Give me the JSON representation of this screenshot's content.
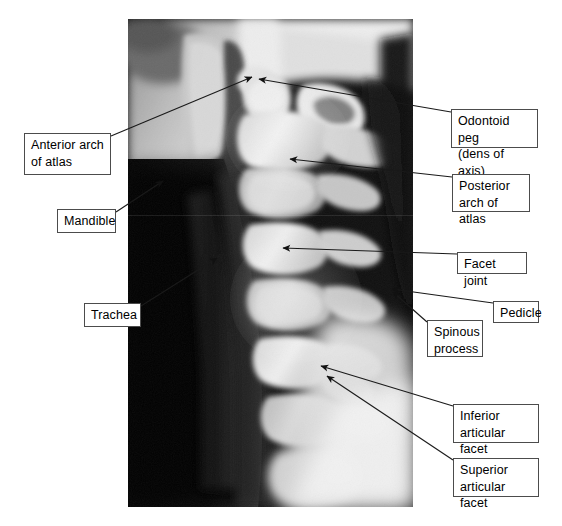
{
  "figure": {
    "kind": "annotated-radiograph",
    "modality": "X-ray",
    "view": "lateral cervical spine",
    "background_color": "#ffffff",
    "label_box": {
      "fill": "#ffffff",
      "border_color": "#4c4c4c",
      "text_color": "#000000"
    },
    "leader_color": "#1a1a1a"
  },
  "xray": {
    "name": "lateral-cervical-spine-radiograph",
    "left": 128,
    "top": 19,
    "width": 285,
    "height": 488
  },
  "labels": [
    {
      "id": "anterior-arch-of-atlas",
      "text": "Anterior arch\nof atlas",
      "side": "left",
      "box": {
        "x": 24,
        "y": 133,
        "w": 87,
        "h": 42
      },
      "leader_from": {
        "x": 111,
        "y": 136
      },
      "leader_to": {
        "x": 252,
        "y": 77
      }
    },
    {
      "id": "mandible",
      "text": "Mandible",
      "side": "left",
      "box": {
        "x": 57,
        "y": 209,
        "w": 59,
        "h": 24
      },
      "leader_from": {
        "x": 116,
        "y": 212
      },
      "leader_to": {
        "x": 163,
        "y": 181
      }
    },
    {
      "id": "trachea",
      "text": "Trachea",
      "side": "left",
      "box": {
        "x": 84,
        "y": 303,
        "w": 57,
        "h": 24
      },
      "leader_from": {
        "x": 141,
        "y": 306
      },
      "leader_to": {
        "x": 217,
        "y": 258
      }
    },
    {
      "id": "odontoid-peg",
      "text": "Odontoid peg\n(dens of axis)",
      "side": "right",
      "box": {
        "x": 451,
        "y": 109,
        "w": 87,
        "h": 39
      },
      "leader_from": {
        "x": 451,
        "y": 112
      },
      "leader_to": {
        "x": 259,
        "y": 79
      }
    },
    {
      "id": "posterior-arch-of-atlas",
      "text": "Posterior\narch of atlas",
      "side": "right",
      "box": {
        "x": 452,
        "y": 174,
        "w": 78,
        "h": 38
      },
      "leader_from": {
        "x": 452,
        "y": 177
      },
      "leader_to": {
        "x": 290,
        "y": 159
      }
    },
    {
      "id": "facet-joint",
      "text": "Facet joint",
      "side": "right",
      "box": {
        "x": 457,
        "y": 252,
        "w": 70,
        "h": 22
      },
      "leader_from": {
        "x": 457,
        "y": 254
      },
      "leader_to": {
        "x": 283,
        "y": 248
      }
    },
    {
      "id": "pedicle",
      "text": "Pedicle",
      "side": "right",
      "box": {
        "x": 493,
        "y": 301,
        "w": 46,
        "h": 22
      },
      "leader_from": {
        "x": 493,
        "y": 303
      },
      "leader_to": {
        "x": 392,
        "y": 289
      }
    },
    {
      "id": "spinous-process",
      "text": "Spinous\nprocess",
      "side": "right",
      "box": {
        "x": 427,
        "y": 320,
        "w": 56,
        "h": 37
      },
      "leader_from": {
        "x": 427,
        "y": 322
      },
      "leader_to": {
        "x": 393,
        "y": 292
      }
    },
    {
      "id": "inferior-articular-facet",
      "text": "Inferior\narticular facet",
      "side": "right",
      "box": {
        "x": 453,
        "y": 404,
        "w": 86,
        "h": 39
      },
      "leader_from": {
        "x": 453,
        "y": 406
      },
      "leader_to": {
        "x": 321,
        "y": 366
      }
    },
    {
      "id": "superior-articular-facet",
      "text": "Superior\narticular facet",
      "side": "right",
      "box": {
        "x": 453,
        "y": 458,
        "w": 86,
        "h": 39
      },
      "leader_from": {
        "x": 453,
        "y": 460
      },
      "leader_to": {
        "x": 327,
        "y": 376
      }
    }
  ]
}
